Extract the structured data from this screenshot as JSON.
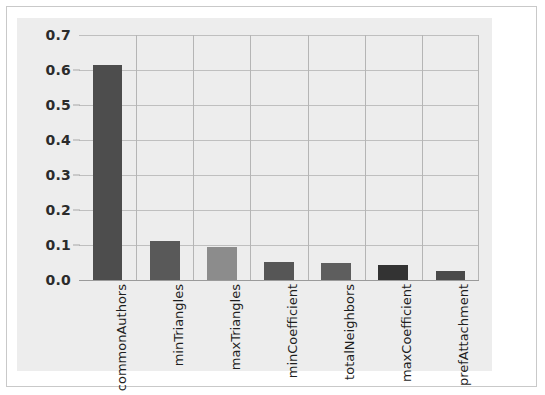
{
  "figure": {
    "background_color": "#ededed",
    "page_background_color": "#ffffff",
    "border_color": "#c9c9c9"
  },
  "chart_data": {
    "type": "bar",
    "title": "",
    "subtitle": "",
    "xlabel": "",
    "ylabel": "",
    "categories": [
      "commonAuthors",
      "minTriangles",
      "maxTriangles",
      "minCoefficient",
      "totalNeighbors",
      "maxCoefficient",
      "prefAttachment"
    ],
    "values": [
      0.615,
      0.112,
      0.093,
      0.052,
      0.05,
      0.042,
      0.025
    ],
    "bar_colors": [
      "#4d4d4d",
      "#595959",
      "#8c8c8c",
      "#565656",
      "#5e5e5e",
      "#333333",
      "#4a4a4a"
    ],
    "ylim": [
      0.0,
      0.7
    ],
    "ytick_values": [
      0.0,
      0.1,
      0.2,
      0.3,
      0.4,
      0.5,
      0.6,
      0.7
    ],
    "ytick_labels": [
      "0.0",
      "0.1",
      "0.2",
      "0.3",
      "0.4",
      "0.5",
      "0.6",
      "0.7"
    ],
    "grid": {
      "horizontal": true,
      "vertical": true,
      "horizontal_color": "#bfbfbf",
      "vertical_color": "#b5b5b5"
    },
    "legend": {
      "visible": false,
      "position": "none",
      "entries": []
    },
    "annotations": [],
    "xtick_rotation": 90
  }
}
